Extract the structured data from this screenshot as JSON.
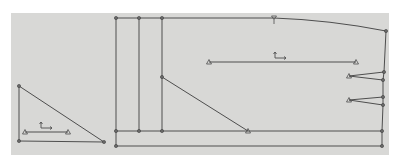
{
  "view": {
    "type": "pattern-drafting-canvas",
    "background": "#d8d8d6",
    "line_color": "#4e4e4e",
    "area": {
      "x": 11,
      "y": 13,
      "w": 378,
      "h": 142
    }
  },
  "pieces": [
    {
      "name": "small-triangle-piece",
      "outline": [
        [
          19,
          86
        ],
        [
          19,
          141
        ],
        [
          104,
          142
        ]
      ],
      "points": [
        [
          19,
          86
        ],
        [
          19,
          141
        ],
        [
          104,
          142
        ]
      ],
      "grain_line": {
        "from": [
          25,
          132
        ],
        "to": [
          68,
          132
        ]
      },
      "grain_symbol": {
        "x": 41,
        "y": 122
      }
    },
    {
      "name": "main-panel-piece",
      "top_edge": [
        [
          116,
          18
        ],
        [
          274,
          18
        ],
        [
          386,
          31
        ]
      ],
      "right_edge": [
        [
          386,
          31
        ],
        [
          384,
          72
        ],
        [
          383,
          80
        ],
        [
          383,
          97
        ],
        [
          383,
          105
        ],
        [
          382,
          131
        ],
        [
          382,
          146
        ]
      ],
      "bottom_edges": [
        {
          "from": [
            116,
            131
          ],
          "to": [
            382,
            131
          ]
        },
        {
          "from": [
            116,
            146
          ],
          "to": [
            382,
            146
          ]
        }
      ],
      "verticals": [
        {
          "x": 116,
          "y1": 18,
          "y2": 146
        },
        {
          "x": 139,
          "y1": 18,
          "y2": 131
        },
        {
          "x": 162,
          "y1": 18,
          "y2": 131
        }
      ],
      "diagonal": {
        "from": [
          162,
          77
        ],
        "to": [
          248,
          131
        ]
      },
      "notch": {
        "x": 274,
        "y": 18
      },
      "darts": [
        {
          "apex": [
            349,
            76
          ],
          "legs": [
            [
              384,
              72
            ],
            [
              383,
              80
            ]
          ]
        },
        {
          "apex": [
            349,
            100
          ],
          "legs": [
            [
              383,
              97
            ],
            [
              383,
              105
            ]
          ]
        }
      ],
      "grain_line": {
        "from": [
          209,
          62
        ],
        "to": [
          356,
          62
        ]
      },
      "grain_symbol": {
        "x": 275,
        "y": 52
      },
      "points": [
        [
          116,
          18
        ],
        [
          139,
          18
        ],
        [
          162,
          18
        ],
        [
          116,
          131
        ],
        [
          139,
          131
        ],
        [
          162,
          131
        ],
        [
          116,
          146
        ],
        [
          162,
          77
        ],
        [
          386,
          31
        ],
        [
          384,
          72
        ],
        [
          383,
          80
        ],
        [
          383,
          97
        ],
        [
          383,
          105
        ],
        [
          382,
          131
        ],
        [
          382,
          146
        ]
      ],
      "triangle_markers": [
        [
          248,
          131
        ],
        [
          209,
          62
        ],
        [
          356,
          62
        ]
      ]
    }
  ]
}
